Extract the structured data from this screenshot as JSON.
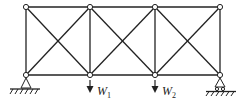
{
  "diagram": {
    "type": "truss",
    "top_nodes": [
      [
        26,
        7
      ],
      [
        90,
        7
      ],
      [
        155,
        7
      ],
      [
        220,
        7
      ]
    ],
    "bottom_nodes": [
      [
        26,
        75
      ],
      [
        90,
        75
      ],
      [
        155,
        75
      ],
      [
        220,
        75
      ]
    ],
    "supports": {
      "left": "pin",
      "right": "roller"
    },
    "loads": [
      {
        "label": "W",
        "subscript": "1",
        "node": 1
      },
      {
        "label": "W",
        "subscript": "2",
        "node": 2
      }
    ]
  }
}
